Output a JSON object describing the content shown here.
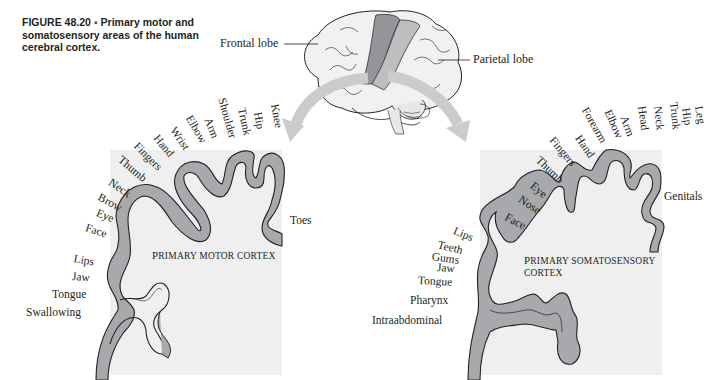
{
  "figure": {
    "number": "FIGURE 48.20",
    "separator": "▪",
    "title": "Primary motor and somatosensory areas of the human cerebral cortex."
  },
  "brain": {
    "frontal_label": "Frontal lobe",
    "parietal_label": "Parietal lobe"
  },
  "motor": {
    "area_label_first": "P",
    "area_label_rest": "RIMARY MOTOR CORTEX",
    "labels": [
      "Knee",
      "Hip",
      "Trunk",
      "Shoulder",
      "Arm",
      "Elbow",
      "Wrist",
      "Hand",
      "Fingers",
      "Thumb",
      "Neck",
      "Brow",
      "Eye",
      "Face",
      "Lips",
      "Jaw",
      "Tongue",
      "Swallowing",
      "Toes"
    ]
  },
  "sensory": {
    "area_label_line1_first": "P",
    "area_label_line1_rest": "RIMARY SOMATOSENSORY",
    "area_label_line2": "CORTEX",
    "labels": [
      "Leg",
      "Hip",
      "Trunk",
      "Neck",
      "Head",
      "Arm",
      "Elbow",
      "Forearm",
      "Hand",
      "Fingers",
      "Thumb",
      "Eye",
      "Nose",
      "Face",
      "Lips",
      "Teeth",
      "Gums",
      "Jaw",
      "Tongue",
      "Pharynx",
      "Intraabdominal",
      "Genitals"
    ]
  },
  "colors": {
    "cortex_fill": "#a7a9ac",
    "interior_fill": "#efeff0",
    "outline": "#231f20",
    "arrow": "#c9cbcd",
    "motor_strip": "#939598",
    "sensory_strip": "#bcbec0"
  }
}
